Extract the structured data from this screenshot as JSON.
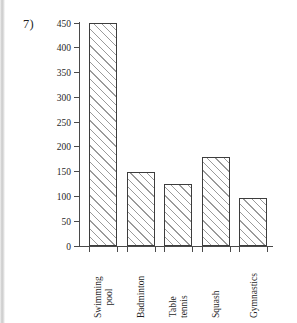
{
  "question": {
    "number": "7)"
  },
  "chart_data": {
    "type": "bar",
    "title": "",
    "subtitle": "",
    "xlabel": "",
    "ylabel": "",
    "categories": [
      "Swimming pool",
      "Badminton",
      "Table tennis",
      "Squash",
      "Gymnastics"
    ],
    "category_lines": [
      [
        "Swimming",
        "pool"
      ],
      [
        "Badminton"
      ],
      [
        "Table",
        "tennis"
      ],
      [
        "Squash"
      ],
      [
        "Gymnastics"
      ]
    ],
    "values": [
      450,
      150,
      125,
      180,
      96
    ],
    "ylim": [
      0,
      450
    ],
    "ytick_labels": [
      "0",
      "50",
      "100",
      "150",
      "200",
      "250",
      "300",
      "350",
      "400",
      "450"
    ],
    "ytick_values": [
      0,
      50,
      100,
      150,
      200,
      250,
      300,
      350,
      400,
      450
    ],
    "grid": false,
    "legend": false,
    "bar_style": {
      "fill": "diagonal-hatch",
      "edge_color": "#3d3d3d",
      "hatch_color": "#9a9a9a",
      "face_color": "#ffffff"
    },
    "axis_color": "#4a4a4a",
    "tick_direction": "out",
    "xtick_label_rotation": -90
  }
}
